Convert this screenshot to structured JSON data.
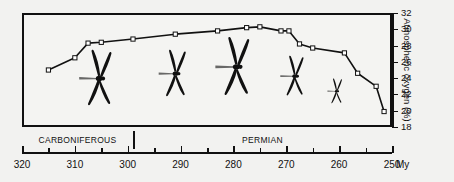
{
  "figure": {
    "background_color": "#f2f2f0",
    "line_color": "#111111",
    "marker_fill": "#ffffff",
    "dragonfly_color": "#111111"
  },
  "y_axis": {
    "title": "Atmospheric oxygen (%)",
    "ticks": [
      18,
      20,
      22,
      24,
      26,
      28,
      30,
      32
    ],
    "min": 18,
    "max": 32
  },
  "x_axis": {
    "unit_label": "My",
    "major_ticks": [
      320,
      310,
      300,
      290,
      280,
      270,
      260,
      250
    ],
    "minor_ticks": [
      315,
      305,
      295,
      285,
      275,
      265,
      255
    ],
    "min": 250,
    "max": 320,
    "reversed": true
  },
  "periods": [
    {
      "label": "CARBONIFEROUS",
      "start": 320,
      "end": 299
    },
    {
      "label": "PERMIAN",
      "start": 299,
      "end": 250
    }
  ],
  "dragonflies": [
    {
      "name": "dragonfly-1",
      "age_my": 305.5,
      "oxygen": 24.0,
      "scale": 1.0
    },
    {
      "name": "dragonfly-2",
      "age_my": 291.0,
      "oxygen": 24.6,
      "scale": 0.84
    },
    {
      "name": "dragonfly-3",
      "age_my": 279.5,
      "oxygen": 25.4,
      "scale": 1.05
    },
    {
      "name": "dragonfly-4",
      "age_my": 268.5,
      "oxygen": 24.3,
      "scale": 0.72
    },
    {
      "name": "dragonfly-5",
      "age_my": 260.5,
      "oxygen": 22.4,
      "scale": 0.45
    }
  ],
  "chart_data": {
    "type": "line",
    "title": "",
    "xlabel": "My",
    "ylabel": "Atmospheric oxygen (%)",
    "xlim": [
      320,
      250
    ],
    "ylim": [
      18,
      32
    ],
    "x_inverted": true,
    "grid": false,
    "legend": "none",
    "marker": "open-square",
    "series": [
      {
        "name": "Atmospheric oxygen",
        "x": [
          315,
          310,
          307.5,
          305,
          299,
          291,
          283,
          277.5,
          275,
          271,
          269.5,
          267.5,
          265,
          259,
          256.5,
          253
        ],
        "values": [
          25.0,
          26.5,
          28.3,
          28.4,
          28.8,
          29.4,
          29.8,
          30.2,
          30.3,
          29.8,
          29.8,
          28.2,
          27.7,
          27.1,
          24.6,
          23.0
        ],
        "x_tail": [
          251.5
        ],
        "values_tail": [
          19.9
        ]
      }
    ],
    "annotations": [
      {
        "text": "CARBONIFEROUS",
        "type": "period-band",
        "x_range": [
          320,
          299
        ]
      },
      {
        "text": "PERMIAN",
        "type": "period-band",
        "x_range": [
          299,
          250
        ]
      },
      {
        "text": "dragonfly silhouettes, decreasing body size through time",
        "type": "pictogram"
      }
    ]
  }
}
